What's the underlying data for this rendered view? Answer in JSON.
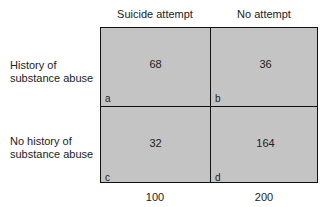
{
  "columns": [
    "Suicide attempt",
    "No attempt"
  ],
  "rows": [
    {
      "label_line1": "History of",
      "label_line2": "substance abuse"
    },
    {
      "label_line1": "No history of",
      "label_line2": "substance abuse"
    }
  ],
  "cells": [
    {
      "id": "a",
      "value": "68"
    },
    {
      "id": "b",
      "value": "36"
    },
    {
      "id": "c",
      "value": "32"
    },
    {
      "id": "d",
      "value": "164"
    }
  ],
  "column_totals": [
    "100",
    "200"
  ],
  "colors": {
    "cell_fill": "#c4c4c4",
    "border": "#111111"
  }
}
